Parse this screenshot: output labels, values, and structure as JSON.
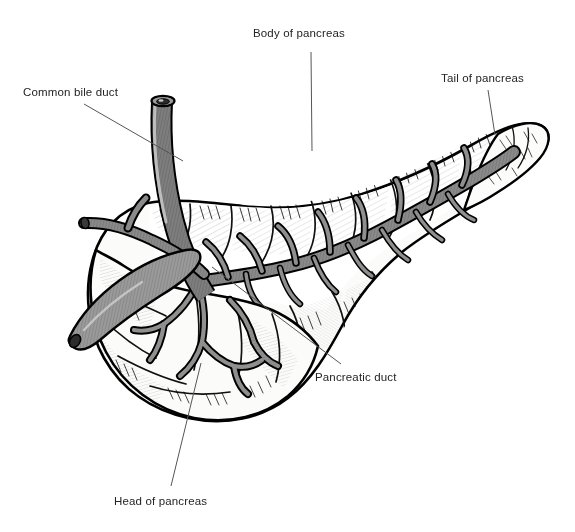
{
  "figure": {
    "background_color": "#ffffff",
    "width": 575,
    "height": 532,
    "style": "black and white pen-and-ink anatomical line drawing with gray wash"
  },
  "labels": {
    "body_of_pancreas": "Body  of  pancreas",
    "tail_of_pancreas": "Tail of pancreas",
    "common_bile_duct": "Common bile duct",
    "pancreatic_duct": "Pancreatic duct",
    "head_of_pancreas": "Head of pancreas"
  },
  "leader_lines": [
    {
      "name": "body-of-pancreas-leader",
      "x1": 311,
      "y1": 52,
      "x2": 312,
      "y2": 151
    },
    {
      "name": "tail-of-pancreas-leader",
      "x1": 488,
      "y1": 90,
      "x2": 495,
      "y2": 135
    },
    {
      "name": "common-bile-duct-leader",
      "x1": 84,
      "y1": 104,
      "x2": 183,
      "y2": 161
    },
    {
      "name": "pancreatic-duct-leader",
      "x1": 212,
      "y1": 267,
      "x2": 341,
      "y2": 364
    },
    {
      "name": "head-of-pancreas-leader",
      "x1": 201,
      "y1": 363,
      "x2": 171,
      "y2": 486
    }
  ],
  "colors": {
    "ink": "#000000",
    "text": "#242424",
    "leader_line": "#555555",
    "duct_gray": "#8a8a8a",
    "duct_gray_dark": "#6e6e6e",
    "parenchyma_light": "#f2f2f0",
    "parenchyma_shade": "#d8d8d6",
    "background": "#ffffff"
  },
  "anatomy_parts": [
    {
      "name": "common-bile-duct",
      "description": "vertical tubular duct descending from top, medium gray with hatching, open lumen at top"
    },
    {
      "name": "head-of-pancreas",
      "description": "bulbous lobulated mass at lower left with arborizing duct tributaries"
    },
    {
      "name": "body-of-pancreas",
      "description": "elongated middle portion with lobulated upper border"
    },
    {
      "name": "tail-of-pancreas",
      "description": "tapering right end curving upward"
    },
    {
      "name": "main-pancreatic-duct",
      "description": "gray branching duct running the length of the gland with fish-bone tributaries"
    },
    {
      "name": "accessory-duct-stump",
      "description": "short gray duct projecting to the left of the head"
    }
  ]
}
